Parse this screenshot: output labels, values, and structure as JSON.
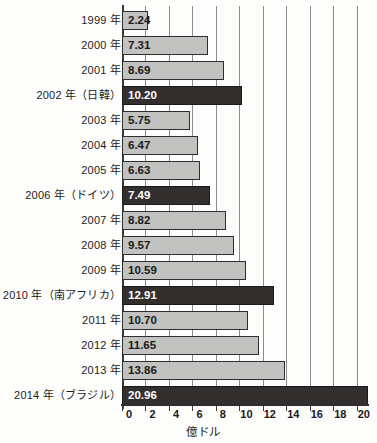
{
  "chart_data": {
    "type": "bar",
    "orientation": "horizontal",
    "title": "",
    "xlabel": "億ドル",
    "ylabel": "",
    "xlim": [
      0,
      21
    ],
    "xticks": [
      0,
      2,
      4,
      6,
      8,
      10,
      12,
      14,
      16,
      18,
      20
    ],
    "grid": true,
    "grid_axis": "x",
    "legend": "none",
    "categories": [
      "1999 年",
      "2000 年",
      "2001 年",
      "2002 年（日韓）",
      "2003 年",
      "2004 年",
      "2005 年",
      "2006 年（ドイツ）",
      "2007 年",
      "2008 年",
      "2009 年",
      "2010 年（南アフリカ）",
      "2011 年",
      "2012 年",
      "2013 年",
      "2014 年（ブラジル）"
    ],
    "values": [
      2.24,
      7.31,
      8.69,
      10.2,
      5.75,
      6.47,
      6.63,
      7.49,
      8.82,
      9.57,
      10.59,
      12.91,
      10.7,
      11.65,
      13.86,
      20.96
    ],
    "value_labels": [
      "2.24",
      "7.31",
      "8.69",
      "10.20",
      "5.75",
      "6.47",
      "6.63",
      "7.49",
      "8.82",
      "9.57",
      "10.59",
      "12.91",
      "10.70",
      "11.65",
      "13.86",
      "20.96"
    ],
    "highlighted": [
      false,
      false,
      false,
      true,
      false,
      false,
      false,
      true,
      false,
      false,
      false,
      true,
      false,
      false,
      false,
      true
    ],
    "colors": {
      "bar_normal": "#c2c2c0",
      "bar_highlight": "#332f2e",
      "bar_border": "#2e2e2e",
      "axis": "#2e2e2e",
      "grid": "#8b8b8b",
      "label_text": "#1c1c1c",
      "value_text_on_light": "#1a1a1a",
      "value_text_on_dark": "#ffffff",
      "background": "#fdfdfc"
    }
  }
}
